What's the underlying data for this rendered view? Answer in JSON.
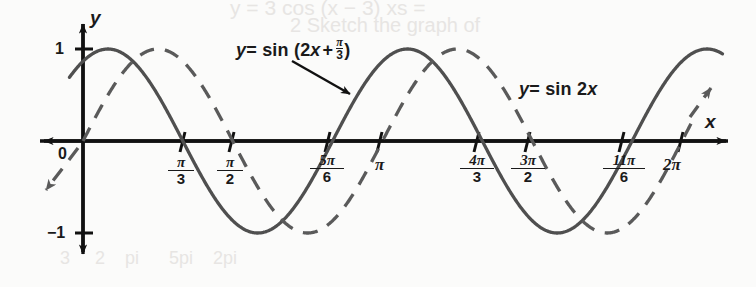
{
  "figure": {
    "background_color": "#fbfbfa",
    "ink_color": "#1a1a1a",
    "curve_color": "#4d4d4d"
  },
  "axes": {
    "x_axis_label": "x",
    "y_axis_label": "y",
    "origin_label": "0",
    "y_ticks": [
      {
        "label": "1",
        "value": 1
      },
      {
        "label": "−1",
        "value": -1
      }
    ],
    "x_ticks": [
      {
        "numerator": "π",
        "denominator": "3",
        "value_pi": 0.3333,
        "type": "fraction"
      },
      {
        "numerator": "π",
        "denominator": "2",
        "value_pi": 0.5,
        "type": "fraction"
      },
      {
        "numerator": "5π",
        "denominator": "6",
        "value_pi": 0.8333,
        "type": "fraction"
      },
      {
        "label": "π",
        "value_pi": 1.0,
        "type": "plain"
      },
      {
        "numerator": "4π",
        "denominator": "3",
        "value_pi": 1.3333,
        "type": "fraction"
      },
      {
        "numerator": "3π",
        "denominator": "2",
        "value_pi": 1.5,
        "type": "fraction"
      },
      {
        "numerator": "11π",
        "denominator": "6",
        "value_pi": 1.8333,
        "type": "fraction"
      },
      {
        "label": "2π",
        "value_pi": 2.0,
        "type": "plain"
      }
    ]
  },
  "curve_labels": {
    "shifted": {
      "prefix": "y",
      "equals": "= sin (2",
      "var": "x",
      "plus": "+",
      "frac_num": "π",
      "frac_den": "3",
      "suffix": ")"
    },
    "basic": {
      "prefix": "y",
      "equals": "= sin 2",
      "var": "x"
    }
  },
  "chart_data": {
    "type": "line",
    "xlabel": "x",
    "ylabel": "y",
    "xlim": [
      -0.19,
      2.25
    ],
    "ylim": [
      -1.45,
      1.45
    ],
    "x_unit": "π radians",
    "grid": false,
    "legend": "inline annotations",
    "xtick_labels": [
      "0",
      "π/3",
      "π/2",
      "5π/6",
      "π",
      "4π/3",
      "3π/2",
      "11π/6",
      "2π"
    ],
    "xtick_values_pi": [
      0,
      0.3333,
      0.5,
      0.8333,
      1.0,
      1.3333,
      1.5,
      1.8333,
      2.0
    ],
    "ytick_labels": [
      "1",
      "−1"
    ],
    "ytick_values": [
      1,
      -1
    ],
    "series": [
      {
        "name": "y = sin (2x + π/3)",
        "style": "solid",
        "amplitude": 1,
        "period_pi": 1.0,
        "phase_shift_pi": -0.16667,
        "formula": "sin(2*x + pi/3)",
        "zeros_pi": [
          -0.16667,
          0.33333,
          0.83333,
          1.33333,
          1.83333
        ],
        "maxima_pi": [
          0.08333,
          1.08333,
          2.08333
        ],
        "minima_pi": [
          0.58333,
          1.58333
        ],
        "y_at_zero": 0.866
      },
      {
        "name": "y = sin 2x",
        "style": "dashed",
        "amplitude": 1,
        "period_pi": 1.0,
        "phase_shift_pi": 0,
        "formula": "sin(2*x)",
        "zeros_pi": [
          0,
          0.5,
          1.0,
          1.5,
          2.0
        ],
        "maxima_pi": [
          0.25,
          1.25,
          2.25
        ],
        "minima_pi": [
          0.75,
          1.75
        ],
        "y_at_zero": 0
      }
    ]
  }
}
